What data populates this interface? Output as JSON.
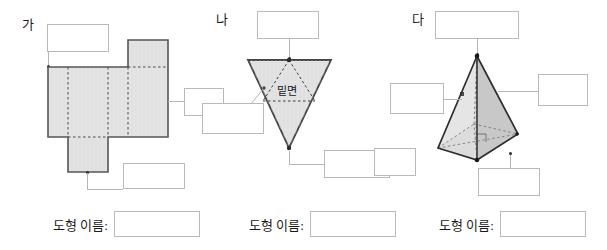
{
  "page": {
    "width": 607,
    "height": 250,
    "background": "#ffffff",
    "ink": "#1a1a1a",
    "box_border": "#b9b9b9",
    "leader_color": "#b5b5b5",
    "face_fill": "#e4e4e4",
    "face_fill_light": "#ececec",
    "face_fill_dark": "#c9c9c9",
    "outline": "#555555",
    "dash_color": "#4a4a4a"
  },
  "panels": [
    {
      "id": "ga",
      "label": "가",
      "figure": "net-of-rectangular-prism",
      "blanks": [
        {
          "name": "top-blank",
          "value": ""
        },
        {
          "name": "right-blank",
          "value": ""
        },
        {
          "name": "bottom-blank",
          "value": ""
        }
      ],
      "name_row": {
        "label": "도형 이름:",
        "value": ""
      }
    },
    {
      "id": "na",
      "label": "나",
      "figure": "inverted-triangular-cone",
      "inner_text": "밑면",
      "blanks": [
        {
          "name": "top-blank",
          "value": ""
        },
        {
          "name": "left-blank",
          "value": ""
        },
        {
          "name": "bottom-right-blank",
          "value": ""
        }
      ],
      "name_row": {
        "label": "도형 이름:",
        "value": ""
      }
    },
    {
      "id": "da",
      "label": "다",
      "figure": "square-pyramid",
      "blanks": [
        {
          "name": "top-blank",
          "value": ""
        },
        {
          "name": "right-blank",
          "value": ""
        },
        {
          "name": "left-blank",
          "value": ""
        },
        {
          "name": "far-left-blank",
          "value": ""
        },
        {
          "name": "bottom-blank",
          "value": ""
        }
      ],
      "name_row": {
        "label": "도형 이름:",
        "value": ""
      }
    }
  ]
}
